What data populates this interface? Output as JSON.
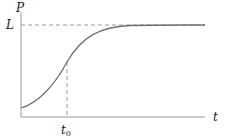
{
  "diagram": {
    "y_axis_label": "P",
    "x_axis_label": "t",
    "asymptote_label": "L",
    "marker_label_main": "t",
    "marker_label_sub": "0",
    "colors": {
      "axis": "#9a9a9a",
      "curve": "#6e6e6e",
      "dashed": "#9a9a9a",
      "text": "#222222"
    }
  }
}
